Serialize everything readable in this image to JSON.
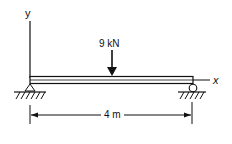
{
  "diagram": {
    "axes": {
      "y_label": "y",
      "x_label": "x"
    },
    "load": {
      "label": "9 kN",
      "type": "point-load-downward"
    },
    "dimension": {
      "label": "4 m"
    },
    "supports": {
      "left": "pin",
      "right": "roller"
    },
    "colors": {
      "line": "#111111",
      "background": "#ffffff"
    }
  }
}
